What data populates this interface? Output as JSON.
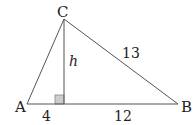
{
  "diagram": {
    "type": "triangle-with-altitude",
    "vertices": {
      "A": {
        "label": "A",
        "x": 27,
        "y": 104
      },
      "B": {
        "label": "B",
        "x": 178,
        "y": 104
      },
      "C": {
        "label": "C",
        "x": 64,
        "y": 19
      }
    },
    "altitude_foot": {
      "x": 64,
      "y": 104
    },
    "labels": {
      "vertex_a": "A",
      "vertex_b": "B",
      "vertex_c": "C",
      "altitude": "h",
      "segment_left": "4",
      "segment_right": "12",
      "side_bc": "13"
    },
    "colors": {
      "line": "#555555",
      "right_angle_fill": "#cccccc",
      "right_angle_stroke": "#888888"
    }
  }
}
